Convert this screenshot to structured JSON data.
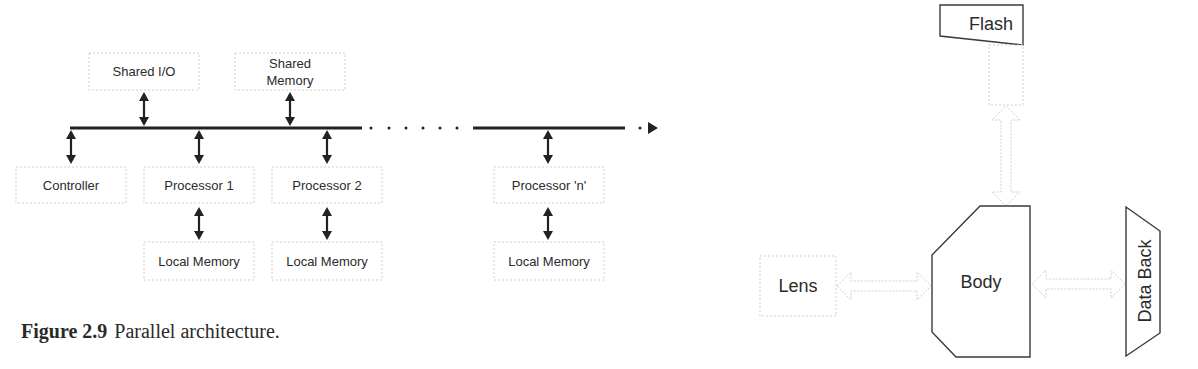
{
  "figure_left": {
    "caption": {
      "number": "Figure 2.9",
      "text": "Parallel architecture."
    },
    "top_nodes": [
      {
        "id": "shared-io",
        "label_lines": [
          "Shared I/O"
        ]
      },
      {
        "id": "shared-memory",
        "label_lines": [
          "Shared",
          "Memory"
        ]
      }
    ],
    "bus_nodes": [
      {
        "id": "controller",
        "label": "Controller"
      },
      {
        "id": "processor-1",
        "label": "Processor 1"
      },
      {
        "id": "processor-2",
        "label": "Processor 2"
      },
      {
        "id": "processor-n",
        "label": "Processor 'n'"
      }
    ],
    "local_memories": [
      {
        "id": "local-memory-1",
        "label": "Local Memory"
      },
      {
        "id": "local-memory-2",
        "label": "Local Memory"
      },
      {
        "id": "local-memory-n",
        "label": "Local Memory"
      }
    ]
  },
  "figure_right": {
    "nodes": {
      "flash": "Flash",
      "lens": "Lens",
      "body": "Body",
      "data_back": "Data Back"
    }
  },
  "colors": {
    "line": "#222222",
    "box_border": "#cfcfcf",
    "shape_border": "#3a3a3a",
    "text": "#2b2b2b"
  }
}
